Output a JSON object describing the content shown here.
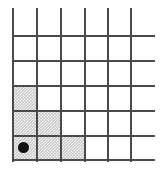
{
  "figure": {
    "colors": {
      "grid_line": "#4a4a4a",
      "shading": "#c9c9c9",
      "marker": "#111111",
      "background": "#ffffff"
    },
    "geometry": {
      "columns": 5,
      "rows": 6,
      "x_lines": [
        12,
        36,
        60,
        84,
        107,
        130
      ],
      "y_lines": [
        10,
        35,
        60,
        85,
        110,
        135,
        160
      ],
      "h_line_start": 12,
      "h_line_end": 155,
      "v_line_start": 8,
      "v_line_end": 162
    },
    "shaded_cells": [
      {
        "name": "shaded-cell-r4c1",
        "col": 1,
        "row": 4,
        "x": 12,
        "y": 85,
        "width": 24,
        "height": 25
      },
      {
        "name": "shaded-cell-r5c1",
        "col": 1,
        "row": 5,
        "x": 12,
        "y": 110,
        "width": 24,
        "height": 25
      },
      {
        "name": "shaded-cell-r5c2",
        "col": 2,
        "row": 5,
        "x": 36,
        "y": 110,
        "width": 24,
        "height": 25
      },
      {
        "name": "shaded-cell-r6c1",
        "col": 1,
        "row": 6,
        "x": 12,
        "y": 135,
        "width": 24,
        "height": 25
      },
      {
        "name": "shaded-cell-r6c2",
        "col": 2,
        "row": 6,
        "x": 36,
        "y": 135,
        "width": 24,
        "height": 25
      },
      {
        "name": "shaded-cell-r6c3",
        "col": 3,
        "row": 6,
        "x": 60,
        "y": 135,
        "width": 24,
        "height": 25
      }
    ],
    "vertical_lines": [
      {
        "name": "grid-line-v-1",
        "x": 12,
        "y": 8,
        "height": 154
      },
      {
        "name": "grid-line-v-2",
        "x": 36,
        "y": 8,
        "height": 154
      },
      {
        "name": "grid-line-v-3",
        "x": 60,
        "y": 8,
        "height": 154
      },
      {
        "name": "grid-line-v-4",
        "x": 84,
        "y": 8,
        "height": 154
      },
      {
        "name": "grid-line-v-5",
        "x": 107,
        "y": 8,
        "height": 154
      },
      {
        "name": "grid-line-v-6",
        "x": 130,
        "y": 8,
        "height": 154
      }
    ],
    "horizontal_lines": [
      {
        "name": "grid-line-h-1",
        "x": 12,
        "y": 35,
        "width": 143
      },
      {
        "name": "grid-line-h-2",
        "x": 12,
        "y": 60,
        "width": 143
      },
      {
        "name": "grid-line-h-3",
        "x": 12,
        "y": 85,
        "width": 143
      },
      {
        "name": "grid-line-h-4",
        "x": 12,
        "y": 110,
        "width": 143
      },
      {
        "name": "grid-line-h-5",
        "x": 12,
        "y": 135,
        "width": 143
      },
      {
        "name": "grid-line-h-6",
        "x": 12,
        "y": 159,
        "width": 143
      }
    ],
    "marker": {
      "name": "marker-dot",
      "label": "position-marker",
      "cx": 23,
      "cy": 147,
      "radius": 5.5
    }
  }
}
